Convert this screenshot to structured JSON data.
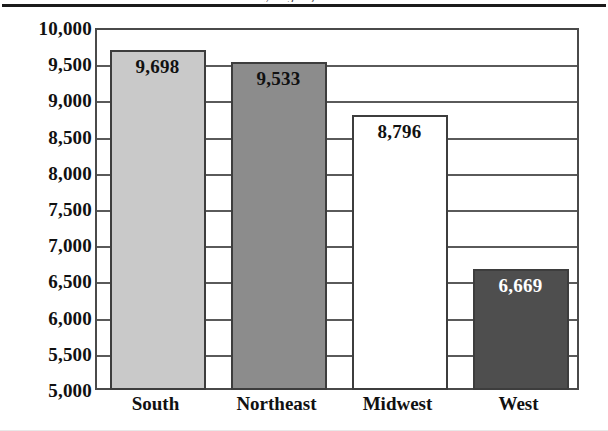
{
  "figure": {
    "caption_remnant": "y Region, 2011",
    "top_rule": "horizontal-rule"
  },
  "chart_data": {
    "type": "bar",
    "title": "",
    "xlabel": "",
    "ylabel": "",
    "categories": [
      "South",
      "Northeast",
      "Midwest",
      "West"
    ],
    "values": [
      9698,
      9533,
      8796,
      6669
    ],
    "value_labels": [
      "9,698",
      "9,533",
      "8,796",
      "6,669"
    ],
    "bar_colors": [
      "#c9c9c9",
      "#8c8c8c",
      "#ffffff",
      "#4e4e4e"
    ],
    "bar_label_colors": [
      "#111111",
      "#111111",
      "#111111",
      "#ffffff"
    ],
    "bar_border_color": "#3d3d3d",
    "ylim": [
      5000,
      10000
    ],
    "ytick_step": 500,
    "yticks": [
      10000,
      9500,
      9000,
      8500,
      8000,
      7500,
      7000,
      6500,
      6000,
      5500,
      5000
    ],
    "ytick_labels": [
      "10,000",
      "9,500",
      "9,000",
      "8,500",
      "8,000",
      "7,500",
      "7,000",
      "6,500",
      "6,000",
      "5,500",
      "5,000"
    ],
    "grid": true,
    "grid_axis": "y",
    "legend": false,
    "legend_position": "none",
    "plot_background": "#ffffff",
    "frame_color": "#4a4a4a"
  }
}
